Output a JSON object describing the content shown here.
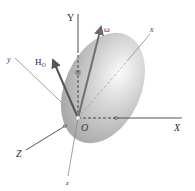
{
  "figure": {
    "origin": {
      "label": "O",
      "pos": [
        78,
        118
      ]
    },
    "fixed_axes": [
      {
        "name": "X",
        "label": "X",
        "end": [
          182,
          118
        ],
        "label_pos": [
          174,
          131
        ]
      },
      {
        "name": "Y",
        "label": "Y",
        "end": [
          78,
          14
        ],
        "label_pos": [
          67,
          21
        ]
      },
      {
        "name": "Z",
        "label": "Z",
        "end": [
          26,
          150
        ],
        "label_pos": [
          16,
          157
        ]
      }
    ],
    "body_axes": [
      {
        "name": "x",
        "label": "x",
        "end": [
          150,
          34
        ],
        "label_pos": [
          150,
          32
        ]
      },
      {
        "name": "y",
        "label": "y",
        "end": [
          15,
          58
        ],
        "label_pos": [
          7,
          62
        ]
      },
      {
        "name": "z",
        "label": "z",
        "end": [
          68,
          176
        ],
        "label_pos": [
          66,
          185
        ]
      }
    ],
    "vectors": [
      {
        "name": "omega",
        "label": "ω",
        "end": [
          101,
          25
        ],
        "label_pos": [
          104,
          32
        ],
        "color": "#6e6e6e"
      },
      {
        "name": "H_O",
        "label": "H",
        "subscript": "O",
        "end": [
          52,
          58
        ],
        "label_pos": [
          35,
          65
        ],
        "color": "#5a5a5a"
      }
    ],
    "body": {
      "shape": "ellipsoid",
      "center": [
        103,
        88
      ],
      "rx": 38,
      "ry": 58,
      "rotation_deg": 24,
      "color_light": "#f2f2f2",
      "color_dark": "#a8a8a8"
    },
    "colors": {
      "axis": "#7a7a7a",
      "axis_fixed": "#555555",
      "text": "#2a2a2a"
    }
  }
}
